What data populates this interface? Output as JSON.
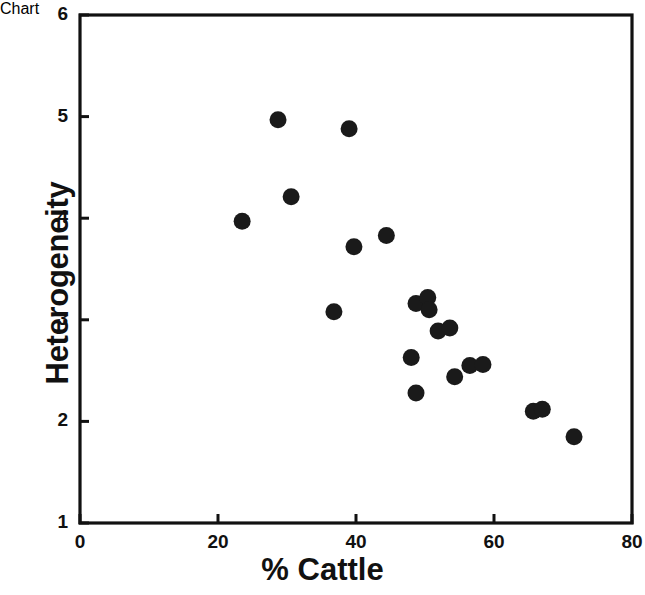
{
  "chart_data": {
    "type": "scatter",
    "title": "",
    "xlabel": "% Cattle",
    "ylabel": "Heterogeneity",
    "xlim": [
      0,
      80
    ],
    "ylim": [
      1,
      6
    ],
    "xticks": [
      "0",
      "20",
      "40",
      "60",
      "80"
    ],
    "xtick_values": [
      0,
      20,
      40,
      60,
      80
    ],
    "yticks": [
      "1",
      "2",
      "3",
      "4",
      "5",
      "6"
    ],
    "ytick_values": [
      1,
      2,
      3,
      4,
      5,
      6
    ],
    "grid": false,
    "legend": null,
    "marker": "filled-circle",
    "marker_color": "#1a1a1a",
    "marker_size": 17,
    "axis_color": "#111111",
    "background": "#ffffff",
    "frame": "box",
    "points": [
      {
        "x": 23.5,
        "y": 3.97
      },
      {
        "x": 28.7,
        "y": 4.97
      },
      {
        "x": 30.6,
        "y": 4.21
      },
      {
        "x": 36.8,
        "y": 3.08
      },
      {
        "x": 39.0,
        "y": 4.88
      },
      {
        "x": 39.7,
        "y": 3.72
      },
      {
        "x": 44.4,
        "y": 3.83
      },
      {
        "x": 48.0,
        "y": 2.63
      },
      {
        "x": 48.7,
        "y": 2.28
      },
      {
        "x": 48.7,
        "y": 3.16
      },
      {
        "x": 50.4,
        "y": 3.22
      },
      {
        "x": 50.6,
        "y": 3.1
      },
      {
        "x": 51.9,
        "y": 2.89
      },
      {
        "x": 53.6,
        "y": 2.92
      },
      {
        "x": 54.3,
        "y": 2.44
      },
      {
        "x": 56.5,
        "y": 2.55
      },
      {
        "x": 58.4,
        "y": 2.56
      },
      {
        "x": 65.7,
        "y": 2.1
      },
      {
        "x": 67.0,
        "y": 2.12
      },
      {
        "x": 71.6,
        "y": 1.85
      }
    ]
  }
}
